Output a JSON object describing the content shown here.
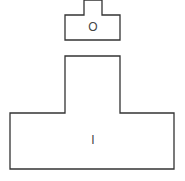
{
  "diagram": {
    "shapes": [
      {
        "id": "small-t-shape",
        "label": "O",
        "points": "84,0 102,0 102,15 120,15 120,40 65,40 65,15 84,15",
        "label_pos": [
          93,
          28
        ]
      },
      {
        "id": "large-t-shape",
        "label": "I",
        "points": "65,56 120,56 120,113 174,113 174,169 10,169 10,113 65,113",
        "label_pos": [
          93,
          141
        ]
      }
    ],
    "colors": {
      "stroke": "#333333",
      "fill": "#ffffff",
      "text": "#444444"
    }
  }
}
